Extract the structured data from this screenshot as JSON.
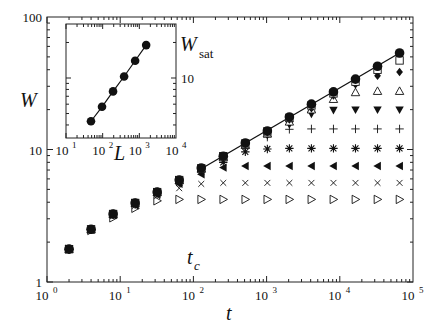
{
  "chart_data": [
    {
      "type": "scatter",
      "title": "",
      "xlabel": "t",
      "ylabel": "W",
      "xscale": "log",
      "yscale": "log",
      "xlim": [
        1,
        100000
      ],
      "ylim": [
        1,
        100
      ],
      "grid": false,
      "legend": "none",
      "x_ticks": [
        "10^0",
        "10^1",
        "10^2",
        "10^3",
        "10^4",
        "10^5"
      ],
      "y_ticks": [
        "1",
        "10",
        "100"
      ],
      "annotations": [
        {
          "text": "t_c",
          "x": 100,
          "y": 1.6
        }
      ],
      "fit_line": {
        "description": "power-law fit through largest system",
        "x": [
          120,
          65536
        ],
        "y": [
          7.0,
          53.5
        ],
        "slope": 0.32
      },
      "x": [
        2,
        4,
        8,
        16,
        32,
        64,
        128,
        256,
        512,
        1024,
        2048,
        4096,
        8192,
        16384,
        32768,
        65536
      ],
      "series": [
        {
          "name": "filled circle",
          "marker": "circle-filled",
          "values": [
            1.77,
            2.5,
            3.26,
            3.95,
            4.77,
            5.88,
            7.25,
            8.9,
            11.2,
            13.8,
            17.6,
            22.0,
            27.2,
            34.0,
            42.5,
            53.5
          ]
        },
        {
          "name": "open square",
          "marker": "square-open",
          "values": [
            1.77,
            2.5,
            3.26,
            3.95,
            4.77,
            5.88,
            7.2,
            8.9,
            11.1,
            13.7,
            17.3,
            21.5,
            26.5,
            32.5,
            40.0,
            47.0
          ]
        },
        {
          "name": "filled diamond",
          "marker": "diamond-filled",
          "values": [
            1.77,
            2.5,
            3.26,
            3.95,
            4.77,
            5.88,
            7.2,
            8.8,
            11.0,
            13.5,
            16.8,
            20.5,
            25.5,
            31.0,
            36.0,
            38.5
          ]
        },
        {
          "name": "open triangle up",
          "marker": "triangle-up-open",
          "values": [
            1.77,
            2.5,
            3.26,
            3.95,
            4.77,
            5.85,
            7.15,
            8.7,
            10.8,
            13.2,
            16.2,
            20.0,
            24.0,
            27.0,
            27.6,
            27.6
          ]
        },
        {
          "name": "filled triangle down",
          "marker": "triangle-down-filled",
          "values": [
            1.77,
            2.5,
            3.26,
            3.95,
            4.75,
            5.8,
            7.1,
            8.6,
            10.5,
            12.8,
            15.4,
            18.5,
            19.8,
            19.9,
            19.9,
            19.9
          ]
        },
        {
          "name": "plus",
          "marker": "plus",
          "values": [
            1.77,
            2.5,
            3.25,
            3.9,
            4.7,
            5.75,
            7.0,
            8.4,
            10.2,
            12.4,
            14.2,
            14.3,
            14.3,
            14.3,
            14.3,
            14.3
          ]
        },
        {
          "name": "asterisk",
          "marker": "asterisk",
          "values": [
            1.77,
            2.49,
            3.22,
            3.85,
            4.65,
            5.6,
            6.8,
            8.0,
            9.6,
            10.1,
            10.2,
            10.2,
            10.2,
            10.2,
            10.2,
            10.2
          ]
        },
        {
          "name": "filled triangle left",
          "marker": "triangle-left-filled",
          "values": [
            1.77,
            2.48,
            3.2,
            3.8,
            4.6,
            5.5,
            6.5,
            7.3,
            7.5,
            7.5,
            7.5,
            7.5,
            7.5,
            7.5,
            7.5,
            7.5
          ]
        },
        {
          "name": "cross",
          "marker": "x",
          "values": [
            1.77,
            2.47,
            3.15,
            3.75,
            4.45,
            5.1,
            5.5,
            5.6,
            5.6,
            5.6,
            5.6,
            5.6,
            5.6,
            5.6,
            5.6,
            5.6
          ]
        },
        {
          "name": "open triangle right",
          "marker": "triangle-right-open",
          "values": [
            1.77,
            2.45,
            3.05,
            3.6,
            4.1,
            4.2,
            4.2,
            4.2,
            4.2,
            4.2,
            4.2,
            4.2,
            4.2,
            4.2,
            4.2,
            4.2
          ]
        }
      ]
    },
    {
      "type": "scatter",
      "title": "inset",
      "xlabel": "L",
      "ylabel": "W_sat",
      "xscale": "log",
      "yscale": "log",
      "xlim": [
        10,
        10000
      ],
      "ylim": [
        3,
        25
      ],
      "x_ticks": [
        "10^1",
        "10^2",
        "10^3",
        "10^4"
      ],
      "y_ticks": [
        "10"
      ],
      "grid": false,
      "fit_line": {
        "description": "power-law fit",
        "slope": 0.75
      },
      "x": [
        48,
        96,
        192,
        384,
        768,
        1536
      ],
      "series": [
        {
          "name": "W_sat",
          "marker": "circle-filled",
          "values": [
            4.3,
            5.7,
            7.7,
            10.3,
            14.0,
            19.0
          ]
        }
      ]
    }
  ],
  "labels": {
    "main_x": "t",
    "main_y": "W",
    "tc": "t",
    "tc_sub": "c",
    "inset_x": "L",
    "inset_y": "W",
    "inset_y_sub": "sat",
    "main_y_ticks": [
      "1",
      "10",
      "100"
    ],
    "main_x_ticks": [
      {
        "b": "10",
        "e": "0"
      },
      {
        "b": "10",
        "e": "1"
      },
      {
        "b": "10",
        "e": "2"
      },
      {
        "b": "10",
        "e": "3"
      },
      {
        "b": "10",
        "e": "4"
      },
      {
        "b": "10",
        "e": "5"
      }
    ],
    "inset_x_ticks": [
      {
        "b": "10",
        "e": "1"
      },
      {
        "b": "10",
        "e": "2"
      },
      {
        "b": "10",
        "e": "3"
      },
      {
        "b": "10",
        "e": "4"
      }
    ],
    "inset_y_tick": "10"
  }
}
